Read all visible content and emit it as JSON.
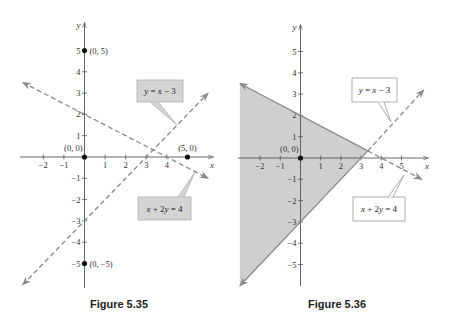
{
  "figures": [
    {
      "id": "fig-5-35",
      "caption": "Figure 5.35",
      "caption_pos": [
        119,
        308
      ],
      "origin_px": [
        84.5,
        157
      ],
      "unit_px": [
        20.6,
        21.3
      ],
      "x_axis_px": [
        20,
        213
      ],
      "y_axis_px": [
        23,
        288
      ],
      "x_ticks": [
        -2,
        -1,
        1,
        2,
        3,
        4
      ],
      "y_ticks": [
        -5,
        -4,
        -3,
        -2,
        -1,
        1,
        2,
        3,
        4,
        5
      ],
      "axis_labels": {
        "x": "x",
        "y": "y"
      },
      "shaded_region": null,
      "lines": [
        {
          "equation": "x + 2y = 4",
          "style": "dashed",
          "color": "#8a8a8a",
          "from": [
            -3.0,
            3.5
          ],
          "to": [
            6.0,
            -1.0
          ],
          "arrows": "both"
        },
        {
          "equation": "y = x − 3",
          "style": "dashed",
          "color": "#8a8a8a",
          "from": [
            -3.0,
            -6.0
          ],
          "to": [
            6.0,
            3.0
          ],
          "arrows": "both"
        }
      ],
      "points": [
        {
          "x": 0,
          "y": 5,
          "label": "(0, 5)",
          "label_side": "right"
        },
        {
          "x": 0,
          "y": 0,
          "label": "(0, 0)",
          "label_side": "above-left"
        },
        {
          "x": 5,
          "y": 0,
          "label": "(5, 0)",
          "label_side": "above"
        },
        {
          "x": 0,
          "y": -5,
          "label": "(0, −5)",
          "label_side": "right"
        }
      ],
      "callouts": [
        {
          "text": "y = x − 3",
          "box": [
            137,
            80,
            46,
            22
          ],
          "fill": "#d4d4d4",
          "stroke": "#b0b0b0",
          "pointer_base": [
            [
              150,
              102
            ],
            [
              158,
              102
            ]
          ],
          "pointer_tip": [
            177,
            125
          ]
        },
        {
          "text": "x + 2y = 4",
          "box": [
            138,
            197,
            53,
            23
          ],
          "fill": "#d4d4d4",
          "stroke": "#b0b0b0",
          "pointer_base": [
            [
              178,
              197
            ],
            [
              184,
              197
            ]
          ],
          "pointer_tip": [
            195,
            172
          ]
        }
      ]
    },
    {
      "id": "fig-5-36",
      "caption": "Figure 5.36",
      "caption_pos": [
        337,
        308
      ],
      "origin_px": [
        300.5,
        158
      ],
      "unit_px": [
        20.2,
        21.3
      ],
      "x_axis_px": [
        238,
        428
      ],
      "y_axis_px": [
        25,
        286
      ],
      "x_ticks": [
        -2,
        -1,
        1,
        2,
        3,
        4,
        5
      ],
      "y_ticks": [
        -5,
        -4,
        -3,
        -2,
        -1,
        1,
        2,
        3,
        4,
        5
      ],
      "axis_labels": {
        "x": "x",
        "y": "y"
      },
      "shaded_region": {
        "color": "#cfcfcf",
        "vertices": [
          [
            -3.0,
            3.5
          ],
          [
            3.333,
            0.333
          ],
          [
            -3.0,
            -6.0
          ]
        ]
      },
      "lines": [
        {
          "equation": "x + 2y = 4",
          "style": "solid",
          "color": "#8a8a8a",
          "from": [
            -3.0,
            3.5
          ],
          "to": [
            3.333,
            0.333
          ],
          "arrows": "start"
        },
        {
          "equation": "x + 2y = 4",
          "style": "dashed",
          "color": "#8a8a8a",
          "from": [
            3.333,
            0.333
          ],
          "to": [
            6.0,
            -1.0
          ],
          "arrows": "end"
        },
        {
          "equation": "y = x − 3",
          "style": "solid",
          "color": "#8a8a8a",
          "from": [
            -3.0,
            -6.0
          ],
          "to": [
            3.333,
            0.333
          ],
          "arrows": "start"
        },
        {
          "equation": "y = x − 3",
          "style": "dashed",
          "color": "#8a8a8a",
          "from": [
            3.333,
            0.333
          ],
          "to": [
            6.1,
            3.2
          ],
          "arrows": "end"
        }
      ],
      "points": [
        {
          "x": 0,
          "y": 0,
          "label": "(0, 0)",
          "label_side": "above-left"
        }
      ],
      "callouts": [
        {
          "text": "y = x − 3",
          "box": [
            352,
            78,
            45,
            24
          ],
          "fill": "#ffffff",
          "stroke": "#9a9a9a",
          "pointer_base": [
            [
              378,
              102
            ],
            [
              384,
              102
            ]
          ],
          "pointer_tip": [
            391,
            122
          ]
        },
        {
          "text": "x + 2y = 4",
          "box": [
            353,
            197,
            52,
            24
          ],
          "fill": "#ffffff",
          "stroke": "#9a9a9a",
          "pointer_base": [
            [
              388,
              197
            ],
            [
              393,
              197
            ]
          ],
          "pointer_tip": [
            404,
            175
          ]
        }
      ]
    }
  ],
  "chart_data": [
    {
      "type": "line",
      "title": "Figure 5.35",
      "xlabel": "x",
      "ylabel": "y",
      "xlim": [
        -3,
        6
      ],
      "ylim": [
        -6,
        6
      ],
      "x_ticks": [
        -2,
        -1,
        1,
        2,
        3,
        4
      ],
      "y_ticks": [
        -5,
        -4,
        -3,
        -2,
        -1,
        1,
        2,
        3,
        4,
        5
      ],
      "grid": false,
      "series": [
        {
          "name": "x + 2y = 4",
          "style": "dashed",
          "points": [
            [
              -3,
              3.5
            ],
            [
              0,
              2
            ],
            [
              4,
              0
            ],
            [
              6,
              -1
            ]
          ]
        },
        {
          "name": "y = x − 3",
          "style": "dashed",
          "points": [
            [
              -3,
              -6
            ],
            [
              0,
              -3
            ],
            [
              3,
              0
            ],
            [
              6,
              3
            ]
          ]
        }
      ],
      "annotations": [
        {
          "point": [
            0,
            5
          ],
          "label": "(0, 5)"
        },
        {
          "point": [
            0,
            0
          ],
          "label": "(0, 0)"
        },
        {
          "point": [
            5,
            0
          ],
          "label": "(5, 0)"
        },
        {
          "point": [
            0,
            -5
          ],
          "label": "(0, −5)"
        }
      ]
    },
    {
      "type": "area",
      "title": "Figure 5.36",
      "xlabel": "x",
      "ylabel": "y",
      "xlim": [
        -3,
        6
      ],
      "ylim": [
        -6,
        6
      ],
      "x_ticks": [
        -2,
        -1,
        1,
        2,
        3,
        4
      ],
      "y_ticks": [
        -5,
        -4,
        -3,
        -2,
        -1,
        1,
        2,
        3,
        4,
        5
      ],
      "grid": false,
      "series": [
        {
          "name": "x + 2y = 4",
          "style": "solid-in-region-dashed-outside",
          "points": [
            [
              -3,
              3.5
            ],
            [
              0,
              2
            ],
            [
              3.333,
              0.333
            ],
            [
              6,
              -1
            ]
          ]
        },
        {
          "name": "y = x − 3",
          "style": "solid-in-region-dashed-outside",
          "points": [
            [
              -3,
              -6
            ],
            [
              0,
              -3
            ],
            [
              3.333,
              0.333
            ],
            [
              6,
              3
            ]
          ]
        }
      ],
      "shaded_region": {
        "description": "x + 2y < 4 and y > x − 3",
        "vertices": [
          [
            -3,
            3.5
          ],
          [
            3.333,
            0.333
          ],
          [
            -3,
            -6
          ]
        ]
      },
      "annotations": [
        {
          "point": [
            0,
            0
          ],
          "label": "(0, 0)"
        }
      ]
    }
  ]
}
